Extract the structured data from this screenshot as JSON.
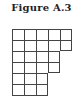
{
  "figure": {
    "title": "Figure A.3",
    "diagram_type": "young-diagram",
    "row_lengths": [
      5,
      5,
      4,
      4,
      3,
      3
    ]
  }
}
